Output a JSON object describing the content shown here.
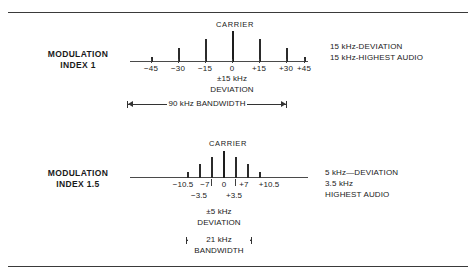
{
  "figure": {
    "title_hidden": "FM spectrum vs modulation index",
    "rules": {
      "top": "",
      "bottom": ""
    }
  },
  "panels": [
    {
      "id": "modulation-index-1",
      "row_label_line1": "MODULATION",
      "row_label_line2": "INDEX 1",
      "carrier_label": "CARRIER",
      "notes": [
        "15 kHz-DEVIATION",
        "15 kHz-HIGHEST AUDIO"
      ],
      "axis_tick_labels": [
        "−45",
        "−30",
        "−15",
        "0",
        "+15",
        "+30",
        "+45"
      ],
      "deviation_label_line1": "±15 kHz",
      "deviation_label_line2": "DEVIATION",
      "bandwidth_label": "90 kHz BANDWIDTH"
    },
    {
      "id": "modulation-index-1-5",
      "row_label_line1": "MODULATION",
      "row_label_line2": "INDEX 1.5",
      "carrier_label": "CARRIER",
      "notes": [
        "5 kHz—DEVIATION",
        "3.5 kHz",
        "HIGHEST AUDIO"
      ],
      "axis_tick_labels": [
        "−10.5",
        "−7",
        "0",
        "+7",
        "+10.5"
      ],
      "axis_tick_labels_inner": [
        "−3.5",
        "+3.5"
      ],
      "deviation_label_line1": "±5 kHz",
      "deviation_label_line2": "DEVIATION",
      "bandwidth_label_line1": "21 kHz",
      "bandwidth_label_line2": "BANDWIDTH"
    }
  ],
  "chart_data": [
    {
      "type": "bar",
      "title": "Modulation Index 1",
      "xlabel": "Frequency offset from carrier (kHz)",
      "ylabel": "Relative amplitude",
      "x": [
        -45,
        -30,
        -15,
        0,
        15,
        30,
        45
      ],
      "values": [
        0.06,
        0.28,
        0.62,
        0.95,
        0.62,
        0.28,
        0.06
      ],
      "tick_labels": [
        "−45",
        "−30",
        "−15",
        "0",
        "+15",
        "+30",
        "+45"
      ],
      "axis_range_khz": [
        -52,
        52
      ],
      "deviation_khz": 15,
      "highest_audio_khz": 15,
      "bandwidth_khz": 90,
      "grid": false,
      "legend": "none"
    },
    {
      "type": "bar",
      "title": "Modulation Index 1.5",
      "xlabel": "Frequency offset from carrier (kHz)",
      "ylabel": "Relative amplitude",
      "x": [
        -10.5,
        -7,
        -3.5,
        0,
        3.5,
        7,
        10.5
      ],
      "values": [
        0.12,
        0.45,
        0.78,
        1.0,
        0.78,
        0.45,
        0.12
      ],
      "tick_labels": [
        "−10.5",
        "−7",
        "−3.5",
        "0",
        "+3.5",
        "+7",
        "+10.5"
      ],
      "axis_range_khz": [
        -52,
        52
      ],
      "deviation_khz": 5,
      "highest_audio_khz": 3.5,
      "bandwidth_khz": 21,
      "grid": false,
      "legend": "none"
    }
  ],
  "colors": {
    "ink": "#1a1a1a",
    "rule": "#3a3a3a",
    "stem": "#2b2b2b",
    "background": "#ffffff"
  }
}
